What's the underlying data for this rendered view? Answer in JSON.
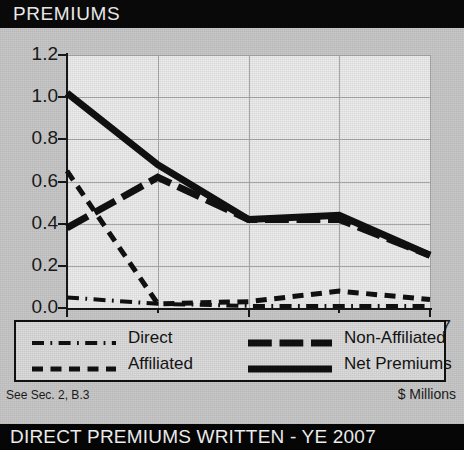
{
  "header": {
    "title": "PREMIUMS"
  },
  "footer": {
    "source_note": "See Sec. 2, B.3",
    "units": "$ Millions",
    "bottom_bar_title": "DIRECT PREMIUMS WRITTEN - YE 2007"
  },
  "colors": {
    "header_bg": "#0a0a0a",
    "header_text": "#f2f2f2",
    "page_bg": "#c9c9c9",
    "plot_bg": "#ededed",
    "grid": "#a9a9a9",
    "axis": "#181818",
    "series": "#111111",
    "legend_bg": "#dcdcdc",
    "legend_border": "#111111"
  },
  "chart_data": {
    "type": "line",
    "title": "PREMIUMS",
    "xlabel": "",
    "ylabel": "",
    "units": "$ Millions",
    "grid": true,
    "legend_position": "below-plot",
    "x": [
      2003,
      2004,
      2005,
      2006,
      2007
    ],
    "xtick_labels": [
      "2003",
      "",
      "2005",
      "",
      "2007"
    ],
    "xlim": [
      2003,
      2007
    ],
    "ylim": [
      0.0,
      1.2
    ],
    "ytick_labels": [
      "0.0",
      "0.2",
      "0.4",
      "0.6",
      "0.8",
      "1.0",
      "1.2"
    ],
    "ytick_values": [
      0.0,
      0.2,
      0.4,
      0.6,
      0.8,
      1.0,
      1.2
    ],
    "series": [
      {
        "name": "Direct",
        "style": "dash-dot",
        "width": 4,
        "values": [
          0.05,
          0.02,
          0.01,
          0.01,
          0.01
        ]
      },
      {
        "name": "Affiliated",
        "style": "dashed",
        "width": 5,
        "values": [
          0.65,
          0.02,
          0.03,
          0.08,
          0.04
        ]
      },
      {
        "name": "Non-Affiliated",
        "style": "long-dash",
        "width": 7,
        "values": [
          0.38,
          0.62,
          0.42,
          0.42,
          0.25
        ]
      },
      {
        "name": "Net Premiums",
        "style": "solid",
        "width": 7,
        "values": [
          1.02,
          0.68,
          0.42,
          0.44,
          0.25
        ]
      }
    ]
  },
  "legend": {
    "entries": [
      {
        "label": "Direct",
        "style": "dash-dot"
      },
      {
        "label": "Non-Affiliated",
        "style": "long-dash"
      },
      {
        "label": "Affiliated",
        "style": "dashed"
      },
      {
        "label": "Net Premiums",
        "style": "solid"
      }
    ]
  }
}
